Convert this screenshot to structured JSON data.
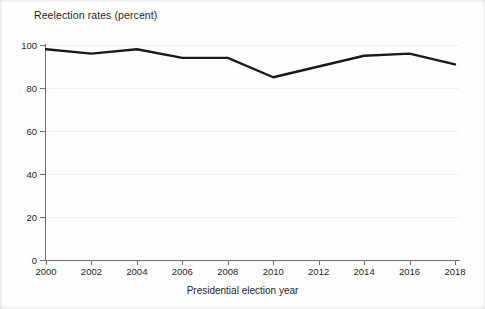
{
  "chart_data": {
    "type": "line",
    "title": "Reelection rates (percent)",
    "xlabel": "Presidential election year",
    "ylabel": "",
    "x": [
      2000,
      2002,
      2004,
      2006,
      2008,
      2010,
      2012,
      2014,
      2016,
      2018
    ],
    "categories": [
      "2000",
      "2002",
      "2004",
      "2006",
      "2008",
      "2010",
      "2012",
      "2014",
      "2016",
      "2018"
    ],
    "values": [
      98,
      96,
      98,
      94,
      94,
      85,
      90,
      95,
      96,
      91
    ],
    "series": [
      {
        "name": "Reelection rate",
        "values": [
          98,
          96,
          98,
          94,
          94,
          85,
          90,
          95,
          96,
          91
        ]
      }
    ],
    "ylim": [
      0,
      100
    ],
    "ytick_labels": [
      "0",
      "20",
      "40",
      "60",
      "80",
      "100"
    ],
    "yticks": [
      0,
      20,
      40,
      60,
      80,
      100
    ],
    "xlim": [
      2000,
      2018
    ],
    "grid": "horizontal",
    "legend": "none",
    "line_color": "#1a1a1a",
    "line_width": 2.4,
    "axis_color": "#6f6f6f",
    "grid_color": "#f1f1f1",
    "background_color": "#fefefe",
    "text_color": "#1f1f1f"
  }
}
